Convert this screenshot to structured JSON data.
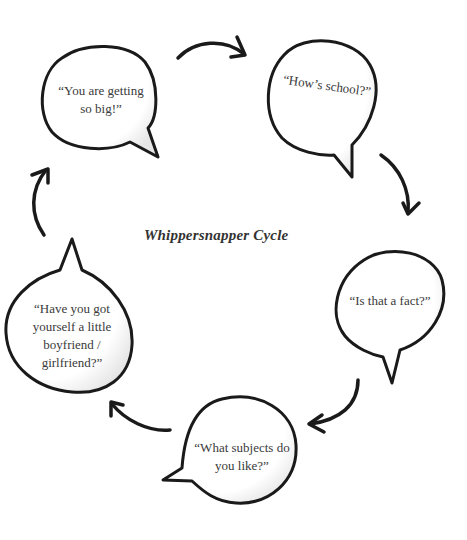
{
  "diagram": {
    "title": "Whippersnapper Cycle",
    "type": "cycle",
    "stroke_color": "#1a1a1a",
    "text_color": "#3a3a3a",
    "nodes": [
      {
        "id": "n1",
        "label_lines": [
          "“You are getting",
          "so big!”"
        ]
      },
      {
        "id": "n2",
        "label_lines": [
          "“How’s school?”"
        ]
      },
      {
        "id": "n3",
        "label_lines": [
          "“Is that a fact?”"
        ]
      },
      {
        "id": "n4",
        "label_lines": [
          "“What subjects do",
          "you like?”"
        ]
      },
      {
        "id": "n5",
        "label_lines": [
          "“Have you got",
          "yourself a little",
          "boyfriend /",
          "girlfriend?”"
        ]
      }
    ],
    "edges": [
      {
        "from": "n1",
        "to": "n2"
      },
      {
        "from": "n2",
        "to": "n3"
      },
      {
        "from": "n3",
        "to": "n4"
      },
      {
        "from": "n4",
        "to": "n5"
      },
      {
        "from": "n5",
        "to": "n1"
      }
    ]
  }
}
